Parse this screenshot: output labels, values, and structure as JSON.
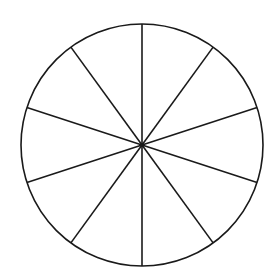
{
  "diagram": {
    "type": "divided-circle",
    "sectors": 10,
    "center": [
      142,
      145
    ],
    "radius": 121,
    "stroke_color": "#1a1a1a",
    "stroke_width": 1.6,
    "background": "#ffffff",
    "spoke_start_angle_deg": -90
  }
}
